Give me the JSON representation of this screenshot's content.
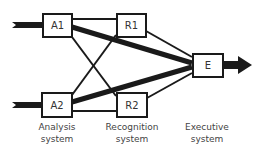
{
  "nodes": {
    "a1": {
      "label": "A1"
    },
    "a2": {
      "label": "A2"
    },
    "r1": {
      "label": "R1"
    },
    "r2": {
      "label": "R2"
    },
    "e": {
      "label": "E"
    }
  },
  "captions": {
    "analysis": {
      "line1": "Analysis",
      "line2": "system"
    },
    "recognition": {
      "line1": "Recognition",
      "line2": "system"
    },
    "executive": {
      "line1": "Executive",
      "line2": "system"
    }
  },
  "edges": [
    {
      "from": "A1",
      "to": "R1",
      "weight": "thin"
    },
    {
      "from": "A1",
      "to": "E",
      "weight": "thick"
    },
    {
      "from": "A1",
      "to": "R2",
      "weight": "thin"
    },
    {
      "from": "A2",
      "to": "R1",
      "weight": "thin"
    },
    {
      "from": "A2",
      "to": "E",
      "weight": "thick"
    },
    {
      "from": "A2",
      "to": "R2",
      "weight": "thin"
    },
    {
      "from": "R1",
      "to": "E",
      "weight": "thin"
    },
    {
      "from": "R2",
      "to": "E",
      "weight": "thin"
    }
  ],
  "colors": {
    "stroke": "#1a1a1a",
    "text": "#333333"
  }
}
